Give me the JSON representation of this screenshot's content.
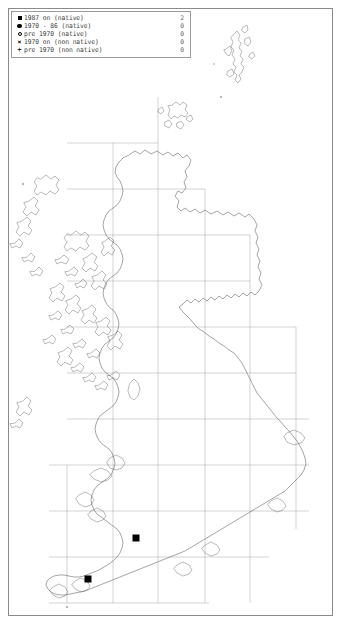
{
  "map": {
    "title": "UK and Ireland species distribution map",
    "projection": "British National Grid",
    "grid": {
      "visible": true,
      "interval_label": "100 km",
      "vertical_lines": [
        20,
        113,
        158,
        205,
        250,
        296
      ],
      "horizontal_lines": [
        143,
        189,
        235,
        281,
        327,
        373,
        419,
        465,
        511,
        557,
        603
      ]
    },
    "background_color": "#ffffff",
    "coastline_color": "#4a4a4a",
    "grid_color": "#9e9e9e",
    "border_color": "#8a8a8a"
  },
  "legend": {
    "border_color": "#9a9a9a",
    "rows": [
      {
        "symbol": "filled-square",
        "label": "1987 on (native)",
        "count": "2"
      },
      {
        "symbol": "filled-circle",
        "label": "1970 - 86 (native)",
        "count": "0"
      },
      {
        "symbol": "open-circle",
        "label": "pre 1970 (native)",
        "count": "0"
      },
      {
        "symbol": "cross-x",
        "label": "1970 on (non native)",
        "count": "0"
      },
      {
        "symbol": "plus",
        "label": "pre 1970 (non native)",
        "count": "0"
      }
    ]
  },
  "chart_data": {
    "type": "map",
    "marker_color": "#000000",
    "records": [
      {
        "symbol": "filled-square",
        "category": "1987 on (native)",
        "x": 136,
        "y": 538,
        "region": "South Wales / Severn"
      },
      {
        "symbol": "filled-square",
        "category": "1987 on (native)",
        "x": 88,
        "y": 579,
        "region": "West Cornwall"
      }
    ],
    "totals": {
      "1987 on (native)": 2,
      "1970 - 86 (native)": 0,
      "pre 1970 (native)": 0,
      "1970 on (non native)": 0,
      "pre 1970 (non native)": 0
    }
  }
}
